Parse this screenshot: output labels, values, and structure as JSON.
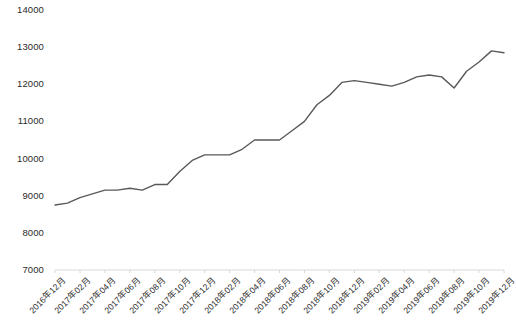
{
  "chart_data": {
    "type": "line",
    "title": "",
    "subtitle": "",
    "xlabel": "",
    "ylabel": "",
    "ylim": [
      7000,
      14000
    ],
    "ytick_values": [
      7000,
      8000,
      9000,
      10000,
      11000,
      12000,
      13000,
      14000
    ],
    "ytick_labels": [
      "7000",
      "8000",
      "9000",
      "10000",
      "11000",
      "12000",
      "13000",
      "14000"
    ],
    "grid": false,
    "legend": false,
    "legend_position": "none",
    "line_color": "#595959",
    "line_width": 1.4,
    "axis_color": "#d9d9d9",
    "background_color": "#ffffff",
    "x": [
      "2016年12月",
      "2017年01月",
      "2017年02月",
      "2017年03月",
      "2017年04月",
      "2017年05月",
      "2017年06月",
      "2017年07月",
      "2017年08月",
      "2017年09月",
      "2017年10月",
      "2017年11月",
      "2017年12月",
      "2018年01月",
      "2018年02月",
      "2018年03月",
      "2018年04月",
      "2018年05月",
      "2018年06月",
      "2018年07月",
      "2018年08月",
      "2018年09月",
      "2018年10月",
      "2018年11月",
      "2018年12月",
      "2019年01月",
      "2019年02月",
      "2019年03月",
      "2019年04月",
      "2019年05月",
      "2019年06月",
      "2019年07月",
      "2019年08月",
      "2019年09月",
      "2019年10月",
      "2019年11月",
      "2019年12月"
    ],
    "xtick_labels": [
      "2016年12月",
      "2017年02月",
      "2017年04月",
      "2017年06月",
      "2017年08月",
      "2017年10月",
      "2017年12月",
      "2018年02月",
      "2018年04月",
      "2018年06月",
      "2018年08月",
      "2018年10月",
      "2018年12月",
      "2019年02月",
      "2019年04月",
      "2019年06月",
      "2019年08月",
      "2019年10月",
      "2019年12月"
    ],
    "xtick_indices": [
      0,
      2,
      4,
      6,
      8,
      10,
      12,
      14,
      16,
      18,
      20,
      22,
      24,
      26,
      28,
      30,
      32,
      34,
      36
    ],
    "values": [
      8750,
      8800,
      8950,
      9050,
      9150,
      9150,
      9200,
      9150,
      9300,
      9300,
      9650,
      9950,
      10100,
      10100,
      10100,
      10250,
      10500,
      10500,
      10500,
      10750,
      11000,
      11450,
      11700,
      12050,
      12100,
      12050,
      12000,
      11950,
      12050,
      12200,
      12250,
      12200,
      11900,
      12350,
      12600,
      12900,
      12850
    ],
    "series": [
      {
        "name": "series-1",
        "values": [
          8750,
          8800,
          8950,
          9050,
          9150,
          9150,
          9200,
          9150,
          9300,
          9300,
          9650,
          9950,
          10100,
          10100,
          10100,
          10250,
          10500,
          10500,
          10500,
          10750,
          11000,
          11450,
          11700,
          12050,
          12100,
          12050,
          12000,
          11950,
          12050,
          12200,
          12250,
          12200,
          11900,
          12350,
          12600,
          12900,
          12850
        ]
      }
    ]
  }
}
